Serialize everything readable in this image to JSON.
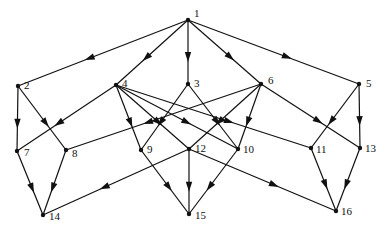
{
  "diagram": {
    "type": "directed-acyclic-graph",
    "colors": {
      "stroke": "#111111",
      "background": "#ffffff"
    },
    "nodes": [
      {
        "id": "1",
        "label": "1",
        "x": 188,
        "y": 20,
        "lx": 6,
        "ly": -3
      },
      {
        "id": "2",
        "label": "2",
        "x": 18,
        "y": 86,
        "lx": 6,
        "ly": 3
      },
      {
        "id": "3",
        "label": "3",
        "x": 188,
        "y": 84,
        "lx": 6,
        "ly": 3
      },
      {
        "id": "4",
        "label": "4",
        "x": 116,
        "y": 85,
        "lx": 6,
        "ly": 2
      },
      {
        "id": "5",
        "label": "5",
        "x": 359,
        "y": 84,
        "lx": 7,
        "ly": 3
      },
      {
        "id": "6",
        "label": "6",
        "x": 261,
        "y": 84,
        "lx": 7,
        "ly": 0
      },
      {
        "id": "7",
        "label": "7",
        "x": 17,
        "y": 151,
        "lx": 7,
        "ly": 5
      },
      {
        "id": "8",
        "label": "8",
        "x": 66,
        "y": 150,
        "lx": 6,
        "ly": 7
      },
      {
        "id": "9",
        "label": "9",
        "x": 141,
        "y": 150,
        "lx": 6,
        "ly": 3
      },
      {
        "id": "10",
        "label": "10",
        "x": 238,
        "y": 149,
        "lx": 5,
        "ly": 4
      },
      {
        "id": "11",
        "label": "11",
        "x": 311,
        "y": 148,
        "lx": 5,
        "ly": 5
      },
      {
        "id": "12",
        "label": "12",
        "x": 189,
        "y": 149,
        "lx": 6,
        "ly": 3
      },
      {
        "id": "13",
        "label": "13",
        "x": 360,
        "y": 148,
        "lx": 5,
        "ly": 4
      },
      {
        "id": "14",
        "label": "14",
        "x": 43,
        "y": 215,
        "lx": 6,
        "ly": 5
      },
      {
        "id": "15",
        "label": "15",
        "x": 189,
        "y": 214,
        "lx": 6,
        "ly": 5
      },
      {
        "id": "16",
        "label": "16",
        "x": 336,
        "y": 211,
        "lx": 5,
        "ly": 4
      }
    ],
    "edges": [
      [
        "1",
        "2"
      ],
      [
        "1",
        "4"
      ],
      [
        "1",
        "3"
      ],
      [
        "1",
        "6"
      ],
      [
        "1",
        "5"
      ],
      [
        "2",
        "7"
      ],
      [
        "2",
        "8"
      ],
      [
        "4",
        "7"
      ],
      [
        "4",
        "9"
      ],
      [
        "4",
        "12"
      ],
      [
        "4",
        "10"
      ],
      [
        "4",
        "11"
      ],
      [
        "3",
        "9"
      ],
      [
        "3",
        "10"
      ],
      [
        "6",
        "8"
      ],
      [
        "6",
        "12"
      ],
      [
        "6",
        "10"
      ],
      [
        "6",
        "13"
      ],
      [
        "5",
        "11"
      ],
      [
        "5",
        "13"
      ],
      [
        "7",
        "14"
      ],
      [
        "8",
        "14"
      ],
      [
        "9",
        "15"
      ],
      [
        "12",
        "14"
      ],
      [
        "12",
        "15"
      ],
      [
        "12",
        "16"
      ],
      [
        "10",
        "15"
      ],
      [
        "11",
        "16"
      ],
      [
        "13",
        "16"
      ]
    ]
  }
}
